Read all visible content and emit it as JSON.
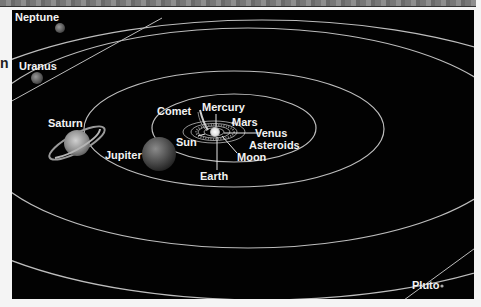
{
  "diagram": {
    "type": "solar-system-orbits",
    "background_color": "#020202",
    "orbit_color": "#bdbdbd",
    "side_text": "n",
    "labels": {
      "neptune": "Neptune",
      "uranus": "Uranus",
      "saturn": "Saturn",
      "jupiter": "Jupiter",
      "comet": "Comet",
      "mercury": "Mercury",
      "mars": "Mars",
      "venus": "Venus",
      "asteroids": "Asteroids",
      "sun": "Sun",
      "moon": "Moon",
      "earth": "Earth",
      "pluto": "Pluto"
    }
  }
}
